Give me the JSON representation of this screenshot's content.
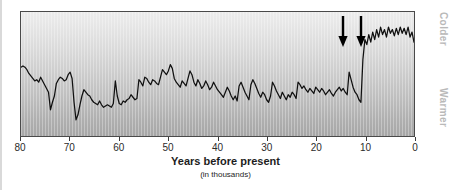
{
  "figure": {
    "name": "greenland-ice-core-temperature-record",
    "axis_title": "Years before present",
    "axis_subtitle": "(in thousands)",
    "right_label_top": "Colder",
    "right_label_bottom": "Warmer",
    "colors": {
      "curve": "#101010",
      "frame": "#4a4a4a",
      "arrow": "#000000",
      "side_label": "#b9b9b9",
      "background_top": "#ececec",
      "background_bottom": "#a6a6a6"
    }
  },
  "chart_data": {
    "type": "line",
    "title": "",
    "xlabel": "Years before present",
    "xlabel_sub": "(in thousands)",
    "ylabel_top": "Colder",
    "ylabel_bottom": "Warmer",
    "xlim": [
      80,
      0
    ],
    "x_ticks": [
      80,
      70,
      60,
      50,
      40,
      30,
      20,
      10,
      0
    ],
    "x_tick_labels": [
      "80",
      "70",
      "60",
      "50",
      "40",
      "30",
      "20",
      "10",
      "0"
    ],
    "ylim": [
      0,
      100
    ],
    "y_axis_inverted": true,
    "grid": false,
    "legend": false,
    "annotations": [
      {
        "type": "arrow",
        "direction": "down",
        "x": 14.6,
        "label": ""
      },
      {
        "type": "arrow",
        "direction": "down",
        "x": 11.0,
        "label": ""
      }
    ],
    "series": [
      {
        "name": "proxy temperature",
        "x": [
          80.0,
          79.6,
          79.2,
          78.8,
          78.4,
          78.0,
          77.6,
          77.2,
          76.8,
          76.4,
          76.0,
          75.6,
          75.2,
          74.8,
          74.4,
          74.0,
          73.6,
          73.2,
          72.8,
          72.4,
          72.0,
          71.6,
          71.2,
          70.8,
          70.4,
          70.0,
          69.6,
          69.2,
          68.8,
          68.4,
          68.0,
          67.6,
          67.2,
          66.8,
          66.4,
          66.0,
          65.6,
          65.2,
          64.8,
          64.4,
          64.0,
          63.6,
          63.2,
          62.8,
          62.4,
          62.0,
          61.6,
          61.2,
          60.8,
          60.4,
          60.0,
          59.6,
          59.2,
          58.8,
          58.4,
          58.0,
          57.6,
          57.2,
          56.8,
          56.4,
          56.0,
          55.6,
          55.2,
          54.8,
          54.4,
          54.0,
          53.6,
          53.2,
          52.8,
          52.4,
          52.0,
          51.6,
          51.2,
          50.8,
          50.4,
          50.0,
          49.6,
          49.2,
          48.8,
          48.4,
          48.0,
          47.6,
          47.2,
          46.8,
          46.4,
          46.0,
          45.6,
          45.2,
          44.8,
          44.4,
          44.0,
          43.6,
          43.2,
          42.8,
          42.4,
          42.0,
          41.6,
          41.2,
          40.8,
          40.4,
          40.0,
          39.6,
          39.2,
          38.8,
          38.4,
          38.0,
          37.6,
          37.2,
          36.8,
          36.4,
          36.0,
          35.6,
          35.2,
          34.8,
          34.4,
          34.0,
          33.6,
          33.2,
          32.8,
          32.4,
          32.0,
          31.6,
          31.2,
          30.8,
          30.4,
          30.0,
          29.6,
          29.2,
          28.8,
          28.4,
          28.0,
          27.6,
          27.2,
          26.8,
          26.4,
          26.0,
          25.6,
          25.2,
          24.8,
          24.4,
          24.0,
          23.6,
          23.2,
          22.8,
          22.4,
          22.0,
          21.6,
          21.2,
          20.8,
          20.4,
          20.0,
          19.6,
          19.2,
          18.8,
          18.4,
          18.0,
          17.6,
          17.2,
          16.8,
          16.4,
          16.0,
          15.6,
          15.2,
          14.8,
          14.4,
          14.0,
          13.6,
          13.2,
          12.8,
          12.4,
          12.0,
          11.6,
          11.2,
          10.8,
          10.4,
          10.0,
          9.6,
          9.2,
          8.8,
          8.4,
          8.0,
          7.6,
          7.2,
          6.8,
          6.4,
          6.0,
          5.6,
          5.2,
          4.8,
          4.4,
          4.0,
          3.6,
          3.2,
          2.8,
          2.4,
          2.0,
          1.6,
          1.2,
          0.8,
          0.4,
          0.0
        ],
        "y": [
          56,
          57,
          56,
          54,
          51,
          49,
          47,
          45,
          46,
          44,
          48,
          45,
          42,
          39,
          36,
          22,
          28,
          33,
          43,
          46,
          48,
          47,
          45,
          46,
          50,
          52,
          47,
          28,
          14,
          18,
          26,
          33,
          38,
          36,
          34,
          33,
          30,
          28,
          27,
          26,
          29,
          26,
          24,
          25,
          26,
          25,
          24,
          27,
          45,
          33,
          27,
          26,
          29,
          28,
          30,
          31,
          34,
          32,
          30,
          31,
          46,
          44,
          41,
          48,
          47,
          44,
          42,
          46,
          45,
          43,
          42,
          48,
          54,
          52,
          50,
          53,
          58,
          55,
          47,
          44,
          42,
          40,
          45,
          43,
          41,
          47,
          53,
          50,
          44,
          41,
          46,
          43,
          39,
          41,
          45,
          42,
          38,
          40,
          44,
          41,
          38,
          36,
          34,
          32,
          36,
          40,
          37,
          33,
          30,
          33,
          29,
          41,
          44,
          40,
          36,
          33,
          30,
          42,
          46,
          43,
          39,
          35,
          32,
          36,
          34,
          30,
          28,
          33,
          44,
          41,
          37,
          34,
          31,
          36,
          33,
          30,
          34,
          32,
          36,
          34,
          31,
          44,
          42,
          39,
          41,
          38,
          36,
          39,
          37,
          35,
          40,
          38,
          36,
          39,
          37,
          34,
          36,
          38,
          35,
          33,
          36,
          38,
          40,
          37,
          39,
          36,
          34,
          52,
          46,
          40,
          36,
          34,
          30,
          28,
          62,
          78,
          74,
          82,
          76,
          84,
          78,
          86,
          80,
          88,
          82,
          86,
          80,
          88,
          83,
          86,
          81,
          87,
          82,
          88,
          83,
          87,
          82,
          88,
          80,
          84,
          76
        ]
      }
    ]
  }
}
